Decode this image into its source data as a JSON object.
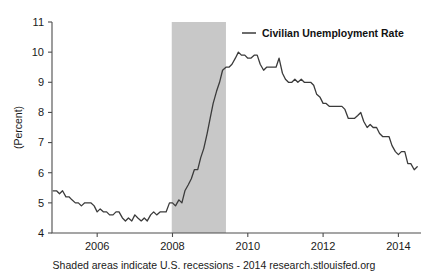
{
  "chart_data": {
    "type": "line",
    "title": "",
    "xlabel": "",
    "ylabel": "(Percent)",
    "ylim": [
      4,
      11
    ],
    "xlim": [
      2004.8,
      2014.6
    ],
    "grid": false,
    "legend_position": "top-right",
    "legend": [
      "Civilian Unemployment Rate"
    ],
    "line_color": "#3b3b3b",
    "recession_color": "#c8c8c8",
    "axis_color": "#4d4d4d",
    "ytick_labels": [
      "4",
      "5",
      "6",
      "7",
      "8",
      "9",
      "10",
      "11"
    ],
    "ytick_values": [
      4,
      5,
      6,
      7,
      8,
      9,
      10,
      11
    ],
    "xtick_labels": [
      "2006",
      "2008",
      "2010",
      "2012",
      "2014"
    ],
    "xtick_values": [
      2006,
      2008,
      2010,
      2012,
      2014
    ],
    "recession_bands": [
      {
        "start": 2007.98,
        "end": 2009.42
      }
    ],
    "footer": "Shaded areas indicate U.S. recessions - 2014 research.stlouisfed.org",
    "series": [
      {
        "name": "Civilian Unemployment Rate",
        "x": [
          2004.83,
          2004.92,
          2005.0,
          2005.08,
          2005.17,
          2005.25,
          2005.33,
          2005.42,
          2005.5,
          2005.58,
          2005.67,
          2005.75,
          2005.83,
          2005.92,
          2006.0,
          2006.08,
          2006.17,
          2006.25,
          2006.33,
          2006.42,
          2006.5,
          2006.58,
          2006.67,
          2006.75,
          2006.83,
          2006.92,
          2007.0,
          2007.08,
          2007.17,
          2007.25,
          2007.33,
          2007.42,
          2007.5,
          2007.58,
          2007.67,
          2007.75,
          2007.83,
          2007.92,
          2008.0,
          2008.08,
          2008.17,
          2008.25,
          2008.33,
          2008.42,
          2008.5,
          2008.58,
          2008.67,
          2008.75,
          2008.83,
          2008.92,
          2009.0,
          2009.08,
          2009.17,
          2009.25,
          2009.33,
          2009.42,
          2009.5,
          2009.58,
          2009.67,
          2009.75,
          2009.83,
          2009.92,
          2010.0,
          2010.08,
          2010.17,
          2010.25,
          2010.33,
          2010.42,
          2010.5,
          2010.58,
          2010.67,
          2010.75,
          2010.83,
          2010.92,
          2011.0,
          2011.08,
          2011.17,
          2011.25,
          2011.33,
          2011.42,
          2011.5,
          2011.58,
          2011.67,
          2011.75,
          2011.83,
          2011.92,
          2012.0,
          2012.08,
          2012.17,
          2012.25,
          2012.33,
          2012.42,
          2012.5,
          2012.58,
          2012.67,
          2012.75,
          2012.83,
          2012.92,
          2013.0,
          2013.08,
          2013.17,
          2013.25,
          2013.33,
          2013.42,
          2013.5,
          2013.58,
          2013.67,
          2013.75,
          2013.83,
          2013.92,
          2014.0,
          2014.08,
          2014.17,
          2014.25,
          2014.33,
          2014.42,
          2014.5
        ],
        "values": [
          5.4,
          5.4,
          5.3,
          5.4,
          5.2,
          5.2,
          5.1,
          5.0,
          5.0,
          4.9,
          5.0,
          5.0,
          5.0,
          4.9,
          4.7,
          4.8,
          4.7,
          4.7,
          4.6,
          4.6,
          4.7,
          4.7,
          4.5,
          4.4,
          4.5,
          4.4,
          4.6,
          4.5,
          4.4,
          4.5,
          4.4,
          4.6,
          4.7,
          4.6,
          4.7,
          4.7,
          4.7,
          5.0,
          5.0,
          4.9,
          5.1,
          5.0,
          5.4,
          5.6,
          5.8,
          6.1,
          6.1,
          6.5,
          6.8,
          7.3,
          7.8,
          8.3,
          8.7,
          9.0,
          9.4,
          9.5,
          9.5,
          9.6,
          9.8,
          10.0,
          9.9,
          9.9,
          9.8,
          9.8,
          9.9,
          9.9,
          9.6,
          9.4,
          9.5,
          9.5,
          9.5,
          9.5,
          9.8,
          9.3,
          9.1,
          9.0,
          9.0,
          9.1,
          9.0,
          9.1,
          9.0,
          9.0,
          9.0,
          8.9,
          8.6,
          8.5,
          8.3,
          8.3,
          8.2,
          8.2,
          8.2,
          8.2,
          8.2,
          8.1,
          7.8,
          7.8,
          7.8,
          7.9,
          8.0,
          7.7,
          7.5,
          7.6,
          7.5,
          7.5,
          7.3,
          7.2,
          7.2,
          7.2,
          6.9,
          6.7,
          6.6,
          6.7,
          6.7,
          6.3,
          6.3,
          6.1,
          6.2
        ]
      }
    ]
  }
}
